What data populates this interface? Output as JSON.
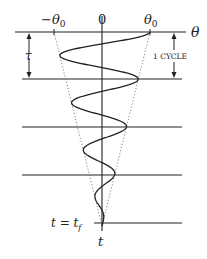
{
  "diagram": {
    "axis_labels": {
      "theta": "θ",
      "time": "t",
      "neg_theta0": "−θ",
      "neg_theta0_sub": "0",
      "zero": "0",
      "theta0": "θ",
      "theta0_sub": "0"
    },
    "annotations": {
      "period": "τ",
      "cycle": "1 CYCLE",
      "final_time_lhs": "t = t",
      "final_time_sub": "f"
    },
    "oscillation": {
      "cycles_shown": 4,
      "initial_amplitude": "θ0",
      "decay": "linear envelope to zero at t = t_f"
    },
    "colors": {
      "line": "#222222",
      "envelope": "#888888"
    }
  }
}
